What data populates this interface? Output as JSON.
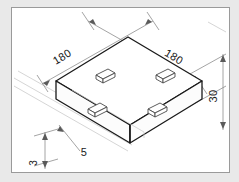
{
  "drawing": {
    "type": "isometric-technical-drawing",
    "object": "square-base-plate-with-four-pads",
    "frame": {
      "border_color": "#9a9a9a",
      "outer_background": "#e9e9e9",
      "sheet_background": "#ffffff"
    },
    "line_colors": {
      "object_outline": "#1a1a1a",
      "hidden_or_light": "#b9b9b9",
      "dimension": "#8d8d8d",
      "pad_outline": "#5a5a5a"
    },
    "dimensions": [
      {
        "id": "width-left",
        "label": "180",
        "rotation": -31,
        "x": 52,
        "y": 52
      },
      {
        "id": "width-right",
        "label": "180",
        "rotation": 31,
        "x": 160,
        "y": 52
      },
      {
        "id": "thickness-right",
        "label": "30",
        "rotation": -90,
        "x": 216,
        "y": 95
      },
      {
        "id": "pad-offset",
        "label": "5",
        "rotation": 0,
        "x": 71,
        "y": 148
      },
      {
        "id": "pad-height",
        "label": "3",
        "rotation": -90,
        "x": 30,
        "y": 155
      }
    ],
    "pads": [
      {
        "id": "pad-rear-left",
        "cx": 88,
        "cy": 76
      },
      {
        "id": "pad-rear-right",
        "cx": 148,
        "cy": 76
      },
      {
        "id": "pad-front-left",
        "cx": 85,
        "cy": 110
      },
      {
        "id": "pad-front-right",
        "cx": 145,
        "cy": 110
      }
    ]
  }
}
